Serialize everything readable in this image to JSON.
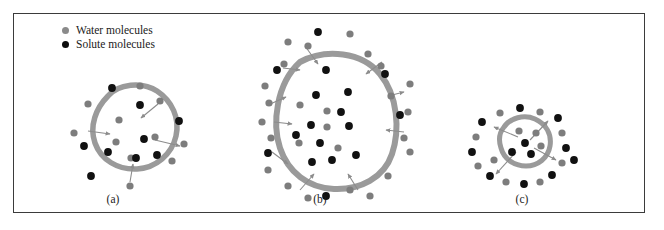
{
  "figure": {
    "background_color": "#ffffff",
    "frame_color": "#3b3b3b"
  },
  "legend": {
    "items": [
      {
        "key": "water",
        "label": "Water molecules",
        "color": "#8a8a8a",
        "marker": "filled-circle"
      },
      {
        "key": "solute",
        "label": "Solute molecules",
        "color": "#0d0d0d",
        "marker": "filled-circle"
      }
    ]
  },
  "colors": {
    "membrane": "#9a9a9a",
    "water_dot": "#7d7d7d",
    "solute_dot": "#111111",
    "arrow": "#8c8c8c",
    "frame": "#3b3b3b",
    "text": "#1a1a1a"
  },
  "panels": [
    {
      "id": "a",
      "caption": "(a)",
      "membrane_path": "M 108 96 C 118 84, 142 81, 157 91 C 172 101, 180 118, 176 136 C 172 154, 156 168, 137 169 C 118 170, 101 160, 95 143 C 89 126, 96 108, 108 96 Z",
      "membrane_width": 5.5,
      "inside_dots": [
        {
          "type": "solute",
          "x": 140,
          "y": 105
        },
        {
          "type": "water",
          "x": 119,
          "y": 120
        },
        {
          "type": "water",
          "x": 116,
          "y": 142
        },
        {
          "type": "solute",
          "x": 144,
          "y": 139
        },
        {
          "type": "solute",
          "x": 108,
          "y": 152
        },
        {
          "type": "water",
          "x": 131,
          "y": 158
        },
        {
          "type": "solute",
          "x": 136,
          "y": 158
        },
        {
          "type": "water",
          "x": 155,
          "y": 137
        },
        {
          "type": "solute",
          "x": 157,
          "y": 155
        }
      ],
      "outside_dots": [
        {
          "type": "solute",
          "x": 112,
          "y": 88
        },
        {
          "type": "water",
          "x": 140,
          "y": 86
        },
        {
          "type": "water",
          "x": 88,
          "y": 104
        },
        {
          "type": "water",
          "x": 160,
          "y": 101
        },
        {
          "type": "solute",
          "x": 179,
          "y": 121
        },
        {
          "type": "water",
          "x": 74,
          "y": 133
        },
        {
          "type": "solute",
          "x": 84,
          "y": 146
        },
        {
          "type": "water",
          "x": 184,
          "y": 144
        },
        {
          "type": "water",
          "x": 172,
          "y": 161
        },
        {
          "type": "solute",
          "x": 91,
          "y": 176
        },
        {
          "type": "water",
          "x": 130,
          "y": 186
        }
      ],
      "arrows": [
        {
          "x1": 158,
          "y1": 104,
          "x2": 141,
          "y2": 118,
          "dir": "in"
        },
        {
          "x1": 88,
          "y1": 131,
          "x2": 110,
          "y2": 134,
          "dir": "in"
        },
        {
          "x1": 130,
          "y1": 182,
          "x2": 133,
          "y2": 164,
          "dir": "in"
        },
        {
          "x1": 155,
          "y1": 140,
          "x2": 180,
          "y2": 146,
          "dir": "out"
        }
      ]
    },
    {
      "id": "b",
      "caption": "(b)",
      "membrane_path": "M 300 62 C 326 48, 362 52, 380 74 C 398 96, 400 130, 392 154 C 384 178, 360 190, 334 189 C 308 188, 288 172, 280 148 C 272 124, 276 84, 300 62 Z",
      "membrane_width": 6,
      "inside_dots": [
        {
          "type": "solute",
          "x": 326,
          "y": 70
        },
        {
          "type": "solute",
          "x": 316,
          "y": 95
        },
        {
          "type": "solute",
          "x": 348,
          "y": 92
        },
        {
          "type": "water",
          "x": 327,
          "y": 111
        },
        {
          "type": "solute",
          "x": 341,
          "y": 112
        },
        {
          "type": "solute",
          "x": 311,
          "y": 125
        },
        {
          "type": "water",
          "x": 327,
          "y": 127
        },
        {
          "type": "solute",
          "x": 349,
          "y": 126
        },
        {
          "type": "water",
          "x": 299,
          "y": 143
        },
        {
          "type": "solute",
          "x": 320,
          "y": 143
        },
        {
          "type": "water",
          "x": 338,
          "y": 148
        },
        {
          "type": "solute",
          "x": 296,
          "y": 135
        },
        {
          "type": "solute",
          "x": 312,
          "y": 162
        },
        {
          "type": "solute",
          "x": 332,
          "y": 160
        },
        {
          "type": "solute",
          "x": 356,
          "y": 155
        },
        {
          "type": "water",
          "x": 300,
          "y": 105
        }
      ],
      "outside_dots": [
        {
          "type": "solute",
          "x": 318,
          "y": 32
        },
        {
          "type": "water",
          "x": 350,
          "y": 34
        },
        {
          "type": "water",
          "x": 288,
          "y": 42
        },
        {
          "type": "water",
          "x": 308,
          "y": 46
        },
        {
          "type": "water",
          "x": 368,
          "y": 54
        },
        {
          "type": "solute",
          "x": 277,
          "y": 70
        },
        {
          "type": "water",
          "x": 284,
          "y": 64
        },
        {
          "type": "water",
          "x": 381,
          "y": 66
        },
        {
          "type": "solute",
          "x": 385,
          "y": 74
        },
        {
          "type": "water",
          "x": 410,
          "y": 84
        },
        {
          "type": "water",
          "x": 265,
          "y": 86
        },
        {
          "type": "water",
          "x": 391,
          "y": 96
        },
        {
          "type": "water",
          "x": 269,
          "y": 103
        },
        {
          "type": "water",
          "x": 408,
          "y": 112
        },
        {
          "type": "water",
          "x": 262,
          "y": 122
        },
        {
          "type": "solute",
          "x": 400,
          "y": 115
        },
        {
          "type": "water",
          "x": 271,
          "y": 138
        },
        {
          "type": "water",
          "x": 404,
          "y": 138
        },
        {
          "type": "solute",
          "x": 268,
          "y": 153
        },
        {
          "type": "water",
          "x": 410,
          "y": 152
        },
        {
          "type": "water",
          "x": 268,
          "y": 170
        },
        {
          "type": "water",
          "x": 388,
          "y": 176
        },
        {
          "type": "water",
          "x": 288,
          "y": 186
        },
        {
          "type": "water",
          "x": 350,
          "y": 190
        },
        {
          "type": "solute",
          "x": 326,
          "y": 196
        },
        {
          "type": "water",
          "x": 308,
          "y": 198
        },
        {
          "type": "water",
          "x": 370,
          "y": 196
        }
      ],
      "arrows": [
        {
          "x1": 305,
          "y1": 46,
          "x2": 318,
          "y2": 64,
          "dir": "in"
        },
        {
          "x1": 382,
          "y1": 62,
          "x2": 366,
          "y2": 74,
          "dir": "in"
        },
        {
          "x1": 283,
          "y1": 68,
          "x2": 300,
          "y2": 70,
          "dir": "in"
        },
        {
          "x1": 268,
          "y1": 105,
          "x2": 286,
          "y2": 97,
          "dir": "out"
        },
        {
          "x1": 388,
          "y1": 96,
          "x2": 404,
          "y2": 92,
          "dir": "out"
        },
        {
          "x1": 274,
          "y1": 122,
          "x2": 292,
          "y2": 124,
          "dir": "out"
        },
        {
          "x1": 404,
          "y1": 132,
          "x2": 386,
          "y2": 130,
          "dir": "in"
        },
        {
          "x1": 272,
          "y1": 152,
          "x2": 288,
          "y2": 164,
          "dir": "out"
        },
        {
          "x1": 300,
          "y1": 190,
          "x2": 314,
          "y2": 174,
          "dir": "in"
        },
        {
          "x1": 358,
          "y1": 190,
          "x2": 348,
          "y2": 174,
          "dir": "in"
        }
      ]
    },
    {
      "id": "c",
      "caption": "(c)",
      "membrane_path": "M 504 127 C 510 118, 524 114, 535 119 C 546 124, 552 134, 550 146 C 548 158, 538 166, 526 166 C 514 166, 504 159, 501 148 C 498 139, 499 133, 504 127 Z",
      "membrane_width": 5,
      "inside_dots": [
        {
          "type": "water",
          "x": 519,
          "y": 131
        },
        {
          "type": "water",
          "x": 536,
          "y": 133
        },
        {
          "type": "solute",
          "x": 525,
          "y": 143
        },
        {
          "type": "solute",
          "x": 512,
          "y": 152
        },
        {
          "type": "solute",
          "x": 531,
          "y": 154
        },
        {
          "type": "water",
          "x": 541,
          "y": 146
        }
      ],
      "outside_dots": [
        {
          "type": "solute",
          "x": 520,
          "y": 108
        },
        {
          "type": "water",
          "x": 500,
          "y": 113
        },
        {
          "type": "water",
          "x": 540,
          "y": 112
        },
        {
          "type": "solute",
          "x": 482,
          "y": 122
        },
        {
          "type": "solute",
          "x": 558,
          "y": 118
        },
        {
          "type": "water",
          "x": 476,
          "y": 137
        },
        {
          "type": "water",
          "x": 562,
          "y": 133
        },
        {
          "type": "solute",
          "x": 472,
          "y": 152
        },
        {
          "type": "solute",
          "x": 566,
          "y": 148
        },
        {
          "type": "water",
          "x": 478,
          "y": 166
        },
        {
          "type": "water",
          "x": 562,
          "y": 163
        },
        {
          "type": "solute",
          "x": 490,
          "y": 176
        },
        {
          "type": "solute",
          "x": 552,
          "y": 175
        },
        {
          "type": "water",
          "x": 506,
          "y": 182
        },
        {
          "type": "solute",
          "x": 524,
          "y": 184
        },
        {
          "type": "water",
          "x": 540,
          "y": 182
        },
        {
          "type": "water",
          "x": 494,
          "y": 160
        },
        {
          "type": "solute",
          "x": 574,
          "y": 160
        }
      ],
      "arrows": [
        {
          "x1": 530,
          "y1": 140,
          "x2": 548,
          "y2": 121,
          "dir": "out"
        },
        {
          "x1": 518,
          "y1": 137,
          "x2": 494,
          "y2": 127,
          "dir": "out"
        },
        {
          "x1": 534,
          "y1": 148,
          "x2": 556,
          "y2": 160,
          "dir": "out"
        },
        {
          "x1": 516,
          "y1": 152,
          "x2": 496,
          "y2": 174,
          "dir": "out"
        }
      ]
    }
  ]
}
